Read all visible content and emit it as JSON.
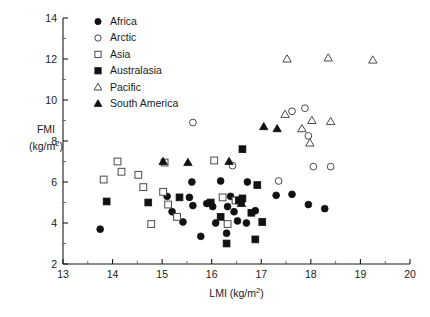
{
  "chart_data": {
    "type": "scatter",
    "title": "",
    "xlabel": "LMI (kg/m2)",
    "xlabel_main": "LMI (kg/m",
    "xlabel_sup": "2",
    "xlabel_tail": ")",
    "ylabel_line1": "FMI",
    "ylabel_line2_main": "(kg/m",
    "ylabel_line2_sup": "2",
    "ylabel_line2_tail": ")",
    "xlim": [
      13,
      20
    ],
    "ylim": [
      2,
      14
    ],
    "xticks": [
      13,
      14,
      15,
      16,
      17,
      18,
      19,
      20
    ],
    "yticks": [
      2,
      4,
      6,
      8,
      10,
      12,
      14
    ],
    "xtick_labels": [
      "13",
      "14",
      "15",
      "16",
      "17",
      "18",
      "19",
      "20"
    ],
    "ytick_labels": [
      "2",
      "4",
      "6",
      "8",
      "10",
      "12",
      "14"
    ],
    "y_minor_ticks": [
      3,
      5,
      7,
      9,
      11,
      13
    ],
    "x_minor_ticks": [
      13.5,
      14.5,
      15.5,
      16.5,
      17.5,
      18.5,
      19.5
    ],
    "grid": false,
    "legend_position": "top-left-inside",
    "series": [
      {
        "name": "Africa",
        "marker": "filled-circle",
        "color": "#111111",
        "points": [
          [
            13.75,
            3.7
          ],
          [
            15.2,
            4.55
          ],
          [
            15.62,
            4.85
          ],
          [
            15.78,
            3.35
          ],
          [
            16.32,
            4.8
          ],
          [
            16.45,
            4.55
          ],
          [
            15.6,
            6.0
          ],
          [
            16.18,
            6.05
          ],
          [
            15.55,
            5.25
          ],
          [
            15.9,
            4.95
          ],
          [
            16.02,
            4.8
          ],
          [
            16.6,
            5.05
          ],
          [
            16.72,
            6.0
          ],
          [
            16.38,
            5.3
          ],
          [
            16.88,
            4.6
          ],
          [
            16.08,
            4.0
          ],
          [
            15.1,
            5.3
          ],
          [
            16.3,
            3.5
          ],
          [
            16.52,
            4.1
          ],
          [
            17.3,
            5.35
          ],
          [
            17.62,
            5.4
          ],
          [
            15.42,
            4.05
          ],
          [
            16.7,
            4.0
          ],
          [
            17.95,
            4.9
          ],
          [
            18.28,
            4.7
          ]
        ]
      },
      {
        "name": "Arctic",
        "marker": "open-circle",
        "color": "#4a4a4a",
        "points": [
          [
            15.62,
            8.9
          ],
          [
            16.42,
            6.8
          ],
          [
            17.62,
            9.45
          ],
          [
            17.88,
            9.6
          ],
          [
            17.95,
            8.25
          ],
          [
            18.05,
            6.75
          ],
          [
            17.35,
            6.05
          ],
          [
            18.4,
            6.75
          ]
        ]
      },
      {
        "name": "Asia",
        "marker": "open-square",
        "color": "#4a4a4a",
        "points": [
          [
            13.82,
            6.12
          ],
          [
            14.18,
            6.5
          ],
          [
            14.1,
            7.0
          ],
          [
            14.62,
            5.75
          ],
          [
            14.52,
            6.35
          ],
          [
            14.78,
            3.95
          ],
          [
            15.02,
            5.52
          ],
          [
            15.3,
            4.3
          ],
          [
            15.05,
            6.95
          ],
          [
            16.05,
            7.05
          ],
          [
            16.22,
            5.25
          ],
          [
            16.48,
            5.1
          ],
          [
            16.32,
            3.95
          ],
          [
            15.12,
            4.9
          ]
        ]
      },
      {
        "name": "Australasia",
        "marker": "filled-square",
        "color": "#111111",
        "points": [
          [
            13.88,
            5.05
          ],
          [
            14.72,
            5.0
          ],
          [
            15.35,
            5.25
          ],
          [
            15.98,
            5.0
          ],
          [
            16.62,
            5.2
          ],
          [
            16.62,
            7.6
          ],
          [
            16.18,
            4.3
          ],
          [
            16.3,
            3.0
          ],
          [
            16.8,
            4.5
          ],
          [
            16.88,
            3.2
          ],
          [
            17.02,
            4.05
          ],
          [
            16.55,
            5.1
          ],
          [
            16.92,
            5.85
          ]
        ]
      },
      {
        "name": "Pacific",
        "marker": "open-triangle",
        "color": "#4a4a4a",
        "points": [
          [
            17.52,
            12.0
          ],
          [
            18.35,
            12.05
          ],
          [
            19.25,
            11.95
          ],
          [
            17.48,
            9.3
          ],
          [
            18.02,
            9.0
          ],
          [
            18.4,
            8.95
          ],
          [
            17.82,
            8.6
          ],
          [
            17.98,
            7.9
          ]
        ]
      },
      {
        "name": "South America",
        "marker": "filled-triangle",
        "color": "#111111",
        "points": [
          [
            15.02,
            7.0
          ],
          [
            15.52,
            6.95
          ],
          [
            16.35,
            7.0
          ],
          [
            17.05,
            8.7
          ],
          [
            16.6,
            4.95
          ],
          [
            17.32,
            8.6
          ]
        ]
      }
    ]
  },
  "legend": {
    "items": [
      {
        "label": "Africa",
        "marker": "filled-circle"
      },
      {
        "label": "Arctic",
        "marker": "open-circle"
      },
      {
        "label": "Asia",
        "marker": "open-square"
      },
      {
        "label": "Australasia",
        "marker": "filled-square"
      },
      {
        "label": "Pacific",
        "marker": "open-triangle"
      },
      {
        "label": "South America",
        "marker": "filled-triangle"
      }
    ]
  }
}
